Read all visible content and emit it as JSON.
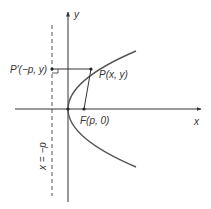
{
  "diagram": {
    "type": "parabola-focus-directrix",
    "colors": {
      "background": "#ffffff",
      "axis": "#333333",
      "curve": "#555555",
      "text": "#333333"
    },
    "labels": {
      "y_axis": "y",
      "x_axis": "x",
      "point_p": "P(x, y)",
      "point_p_prime": "P′(−p, y)",
      "focus": "F(p, 0)",
      "directrix": "x = −p"
    }
  }
}
